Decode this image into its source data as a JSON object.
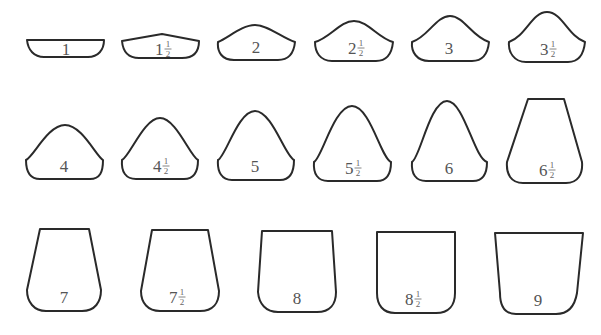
{
  "diagram": {
    "type": "shape-size-chart",
    "rows": [
      {
        "items": [
          {
            "id": "s1",
            "whole": "1",
            "half": false,
            "path": "M27,40 L104,40 C104,50 98,57 88,57 L44,57 C34,57 28,50 27,40 Z",
            "label_x": 66,
            "label_y": 55
          },
          {
            "id": "s1h",
            "whole": "1",
            "half": true,
            "path": "M122,41 L162,34 L199,41 C199,52 193,58 182,58 L139,58 C129,58 123,52 122,41 Z",
            "label_x": 155,
            "label_y": 55
          },
          {
            "id": "s2",
            "whole": "2",
            "half": false,
            "path": "M218,42 C228,38 242,25 255,25 C268,25 282,38 295,42 C294,52 290,60 278,60 L234,60 C222,60 217,52 218,42 Z",
            "label_x": 256,
            "label_y": 53
          },
          {
            "id": "s2h",
            "whole": "2",
            "half": true,
            "path": "M315,42 C330,38 340,21 354,21 C368,21 378,38 393,42 C392,52 388,61 376,61 L332,61 C320,61 315,52 315,42 Z",
            "label_x": 348,
            "label_y": 54
          },
          {
            "id": "s3",
            "whole": "3",
            "half": false,
            "path": "M412,42 C428,37 436,16 450,16 C464,16 472,37 489,42 C488,52 484,61 472,61 L429,61 C417,61 411,52 412,42 Z",
            "label_x": 449,
            "label_y": 54
          },
          {
            "id": "s3h",
            "whole": "3",
            "half": true,
            "path": "M509,42 C526,36 532,12 547,12 C562,12 568,36 585,42 C584,52 580,62 568,62 L526,62 C514,62 508,52 509,42 Z",
            "label_x": 540,
            "label_y": 55
          }
        ]
      },
      {
        "items": [
          {
            "id": "s4",
            "whole": "4",
            "half": false,
            "path": "M26,160 C34,156 48,125 65,125 C82,125 96,156 103,160 C103,172 100,179 90,179 L40,179 C30,179 26,172 26,160 Z",
            "label_x": 64,
            "label_y": 172
          },
          {
            "id": "s4h",
            "whole": "4",
            "half": true,
            "path": "M122,160 C130,156 144,118 160,118 C176,118 190,156 198,160 C198,172 194,179 184,179 L136,179 C126,179 121,172 122,160 Z",
            "label_x": 153,
            "label_y": 172
          },
          {
            "id": "s5",
            "whole": "5",
            "half": false,
            "path": "M218,160 C226,156 238,111 255,111 C272,111 285,156 294,160 C294,172 290,180 280,180 L232,180 C222,180 217,172 218,160 Z",
            "label_x": 255,
            "label_y": 172
          },
          {
            "id": "s5h",
            "whole": "5",
            "half": true,
            "path": "M314,162 C322,158 334,106 352,106 C370,106 381,158 391,162 C391,174 387,181 377,181 L328,181 C318,181 313,174 314,162 Z",
            "label_x": 345,
            "label_y": 174
          },
          {
            "id": "s6",
            "whole": "6",
            "half": false,
            "path": "M412,162 C420,158 430,101 447,101 C464,101 474,158 487,162 C487,174 483,181 473,181 L426,181 C416,181 411,174 412,162 Z",
            "label_x": 449,
            "label_y": 174
          },
          {
            "id": "s6h",
            "whole": "6",
            "half": true,
            "path": "M528,99 L564,99 L582,162 C583,174 578,183 566,183 L523,183 C511,183 506,174 507,162 Z",
            "label_x": 539,
            "label_y": 176
          }
        ]
      },
      {
        "items": [
          {
            "id": "s7",
            "whole": "7",
            "half": false,
            "path": "M40,229 L89,229 L101,290 C101,302 95,311 82,311 L46,311 C34,311 27,302 27,290 Z",
            "label_x": 64,
            "label_y": 303
          },
          {
            "id": "s7h",
            "whole": "7",
            "half": true,
            "path": "M152,230 L208,230 L219,291 C219,303 213,311 200,311 L160,311 C148,311 141,303 141,291 Z",
            "label_x": 169,
            "label_y": 303
          },
          {
            "id": "s8",
            "whole": "8",
            "half": false,
            "path": "M262,231 L332,231 L336,292 C336,304 330,312 317,312 L278,312 C266,312 259,304 258,292 Z",
            "label_x": 297,
            "label_y": 304
          },
          {
            "id": "s8h",
            "whole": "8",
            "half": true,
            "path": "M377,232 L455,232 L455,293 C455,305 449,313 436,313 L395,313 C383,313 377,305 377,293 Z",
            "label_x": 405,
            "label_y": 305
          },
          {
            "id": "s9",
            "whole": "9",
            "half": false,
            "path": "M495,233 L583,233 L577,293 C575,305 569,314 556,314 L516,314 C504,314 500,305 500,293 Z",
            "label_x": 538,
            "label_y": 306
          }
        ]
      }
    ],
    "half_fraction": {
      "numerator": "1",
      "denominator": "2"
    },
    "stroke_color": "#2a2a2a",
    "label_color": "#555555",
    "background": "#ffffff"
  }
}
